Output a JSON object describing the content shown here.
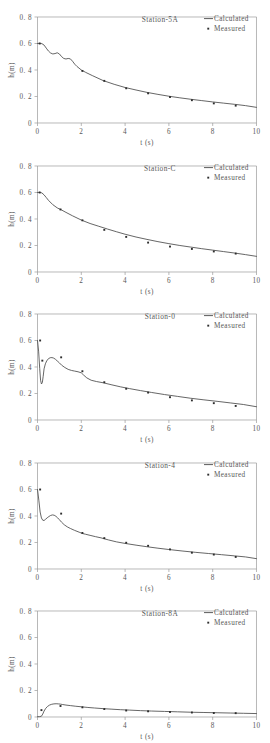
{
  "figure": {
    "panel_count": 5,
    "shared": {
      "xlabel": "t (s)",
      "ylabel": "h(m)",
      "xlim": [
        0,
        10
      ],
      "ylim": [
        0,
        0.8
      ],
      "xticks": [
        "0",
        "2",
        "4",
        "6",
        "8",
        "10"
      ],
      "xtick_values": [
        0,
        2,
        4,
        6,
        8,
        10
      ],
      "yticks": [
        "0",
        "0. 2",
        "0. 4",
        "0. 6",
        "0. 8"
      ],
      "ytick_values": [
        0,
        0.2,
        0.4,
        0.6,
        0.8
      ],
      "legend": {
        "calculated_label": "Calculated",
        "measured_label": "Measured",
        "line_color": "#4a4a4a",
        "point_color": "#2e2e2e"
      },
      "grid": false,
      "legend_position": "top-right"
    }
  },
  "chart_data": [
    {
      "type": "line",
      "title": "Station-5A",
      "xlabel": "t (s)",
      "ylabel": "h(m)",
      "xlim": [
        0,
        10
      ],
      "ylim": [
        0,
        0.8
      ],
      "series": [
        {
          "name": "Calculated",
          "x": [
            0.0,
            0.1,
            0.2,
            0.3,
            0.4,
            0.5,
            0.6,
            0.7,
            0.8,
            0.9,
            1.0,
            1.1,
            1.2,
            1.3,
            1.4,
            1.5,
            1.6,
            1.7,
            1.8,
            2.0,
            2.2,
            2.5,
            3.0,
            3.5,
            4.0,
            4.5,
            5.0,
            5.5,
            6.0,
            6.5,
            7.0,
            7.5,
            8.0,
            8.5,
            9.0,
            9.5,
            10.0
          ],
          "y": [
            0.6,
            0.601,
            0.599,
            0.588,
            0.565,
            0.543,
            0.528,
            0.521,
            0.524,
            0.53,
            0.521,
            0.501,
            0.487,
            0.483,
            0.487,
            0.484,
            0.466,
            0.444,
            0.427,
            0.4,
            0.382,
            0.358,
            0.32,
            0.292,
            0.268,
            0.249,
            0.231,
            0.216,
            0.202,
            0.19,
            0.179,
            0.169,
            0.159,
            0.15,
            0.141,
            0.131,
            0.118
          ]
        },
        {
          "name": "Measured",
          "x": [
            0.1,
            2.05,
            3.05,
            4.05,
            5.05,
            6.05,
            7.05,
            8.05,
            9.05
          ],
          "y": [
            0.6,
            0.393,
            0.318,
            0.262,
            0.224,
            0.196,
            0.172,
            0.148,
            0.131
          ]
        }
      ]
    },
    {
      "type": "line",
      "title": "Station-C",
      "xlabel": "t (s)",
      "ylabel": "h(m)",
      "xlim": [
        0,
        10
      ],
      "ylim": [
        0,
        0.8
      ],
      "series": [
        {
          "name": "Calculated",
          "x": [
            0.0,
            0.1,
            0.2,
            0.3,
            0.4,
            0.5,
            0.7,
            0.9,
            1.1,
            1.3,
            1.6,
            2.0,
            2.4,
            2.8,
            3.2,
            3.6,
            4.0,
            4.5,
            5.0,
            5.5,
            6.0,
            6.5,
            7.0,
            7.5,
            8.0,
            8.5,
            9.0,
            9.5,
            10.0
          ],
          "y": [
            0.6,
            0.601,
            0.597,
            0.582,
            0.562,
            0.541,
            0.508,
            0.484,
            0.468,
            0.45,
            0.424,
            0.392,
            0.366,
            0.345,
            0.324,
            0.304,
            0.285,
            0.264,
            0.246,
            0.229,
            0.214,
            0.2,
            0.188,
            0.176,
            0.165,
            0.154,
            0.143,
            0.131,
            0.118
          ]
        },
        {
          "name": "Measured",
          "x": [
            0.1,
            1.05,
            2.05,
            3.05,
            4.05,
            5.05,
            6.05,
            7.05,
            8.05,
            9.05
          ],
          "y": [
            0.6,
            0.472,
            0.39,
            0.318,
            0.265,
            0.222,
            0.192,
            0.174,
            0.155,
            0.139
          ]
        }
      ]
    },
    {
      "type": "line",
      "title": "Station-0",
      "xlabel": "t (s)",
      "ylabel": "h(m)",
      "xlim": [
        0,
        10
      ],
      "ylim": [
        0,
        0.8
      ],
      "series": [
        {
          "name": "Calculated",
          "x": [
            0.0,
            0.05,
            0.1,
            0.14,
            0.18,
            0.22,
            0.26,
            0.3,
            0.36,
            0.42,
            0.5,
            0.58,
            0.66,
            0.74,
            0.82,
            0.9,
            1.0,
            1.1,
            1.25,
            1.4,
            1.55,
            1.7,
            1.85,
            2.0,
            2.1,
            2.25,
            2.45,
            2.7,
            3.0,
            3.4,
            3.8,
            4.2,
            4.7,
            5.2,
            5.8,
            6.4,
            7.0,
            7.6,
            8.2,
            8.8,
            9.4,
            10.0
          ],
          "y": [
            0.6,
            0.52,
            0.39,
            0.3,
            0.272,
            0.282,
            0.33,
            0.386,
            0.424,
            0.446,
            0.463,
            0.47,
            0.471,
            0.467,
            0.458,
            0.446,
            0.431,
            0.414,
            0.396,
            0.382,
            0.374,
            0.369,
            0.364,
            0.356,
            0.34,
            0.318,
            0.3,
            0.29,
            0.281,
            0.265,
            0.25,
            0.237,
            0.222,
            0.208,
            0.192,
            0.178,
            0.164,
            0.152,
            0.141,
            0.129,
            0.117,
            0.1
          ]
        },
        {
          "name": "Measured",
          "x": [
            0.12,
            0.22,
            1.08,
            2.05,
            3.05,
            4.05,
            5.05,
            6.05,
            7.05,
            8.05,
            9.05
          ],
          "y": [
            0.6,
            0.448,
            0.473,
            0.368,
            0.285,
            0.236,
            0.207,
            0.172,
            0.148,
            0.127,
            0.106
          ]
        }
      ]
    },
    {
      "type": "line",
      "title": "Station-4",
      "xlabel": "t (s)",
      "ylabel": "h(m)",
      "xlim": [
        0,
        10
      ],
      "ylim": [
        0,
        0.8
      ],
      "series": [
        {
          "name": "Calculated",
          "x": [
            0.0,
            0.06,
            0.12,
            0.18,
            0.24,
            0.3,
            0.36,
            0.44,
            0.52,
            0.6,
            0.68,
            0.76,
            0.84,
            0.92,
            1.0,
            1.1,
            1.22,
            1.36,
            1.5,
            1.7,
            1.9,
            2.05,
            2.2,
            2.4,
            2.65,
            2.9,
            3.05,
            3.25,
            3.6,
            4.0,
            4.5,
            5.0,
            5.5,
            6.0,
            6.6,
            7.2,
            7.8,
            8.4,
            9.0,
            9.5,
            10.0
          ],
          "y": [
            0.6,
            0.52,
            0.43,
            0.385,
            0.368,
            0.366,
            0.374,
            0.386,
            0.396,
            0.404,
            0.408,
            0.406,
            0.398,
            0.386,
            0.372,
            0.353,
            0.334,
            0.318,
            0.306,
            0.291,
            0.278,
            0.268,
            0.262,
            0.254,
            0.244,
            0.235,
            0.228,
            0.219,
            0.205,
            0.193,
            0.18,
            0.168,
            0.157,
            0.147,
            0.136,
            0.126,
            0.117,
            0.108,
            0.099,
            0.091,
            0.078
          ]
        },
        {
          "name": "Measured",
          "x": [
            0.12,
            1.08,
            2.05,
            3.05,
            4.05,
            5.05,
            6.05,
            7.05,
            8.05,
            9.05
          ],
          "y": [
            0.6,
            0.418,
            0.272,
            0.233,
            0.198,
            0.175,
            0.148,
            0.123,
            0.109,
            0.091
          ]
        }
      ]
    },
    {
      "type": "line",
      "title": "Station-8A",
      "xlabel": "t (s)",
      "ylabel": "h(m)",
      "xlim": [
        0,
        10
      ],
      "ylim": [
        0,
        0.8
      ],
      "series": [
        {
          "name": "Calculated",
          "x": [
            0.0,
            0.1,
            0.18,
            0.24,
            0.3,
            0.38,
            0.46,
            0.55,
            0.65,
            0.75,
            0.85,
            0.95,
            1.05,
            1.15,
            1.3,
            1.5,
            1.75,
            2.0,
            2.3,
            2.6,
            3.0,
            3.4,
            3.8,
            4.2,
            4.7,
            5.2,
            5.8,
            6.4,
            7.0,
            7.6,
            8.2,
            8.8,
            9.4,
            10.0
          ],
          "y": [
            0.002,
            0.003,
            0.006,
            0.022,
            0.045,
            0.066,
            0.08,
            0.09,
            0.096,
            0.099,
            0.1,
            0.099,
            0.097,
            0.094,
            0.09,
            0.086,
            0.081,
            0.077,
            0.072,
            0.068,
            0.063,
            0.059,
            0.055,
            0.052,
            0.048,
            0.045,
            0.042,
            0.039,
            0.036,
            0.034,
            0.032,
            0.03,
            0.028,
            0.026
          ]
        },
        {
          "name": "Measured",
          "x": [
            0.18,
            1.05,
            2.05,
            3.05,
            4.05,
            5.05,
            6.05,
            7.05,
            8.05,
            9.05
          ],
          "y": [
            0.052,
            0.083,
            0.073,
            0.06,
            0.049,
            0.043,
            0.038,
            0.034,
            0.03,
            0.029
          ]
        }
      ]
    }
  ]
}
